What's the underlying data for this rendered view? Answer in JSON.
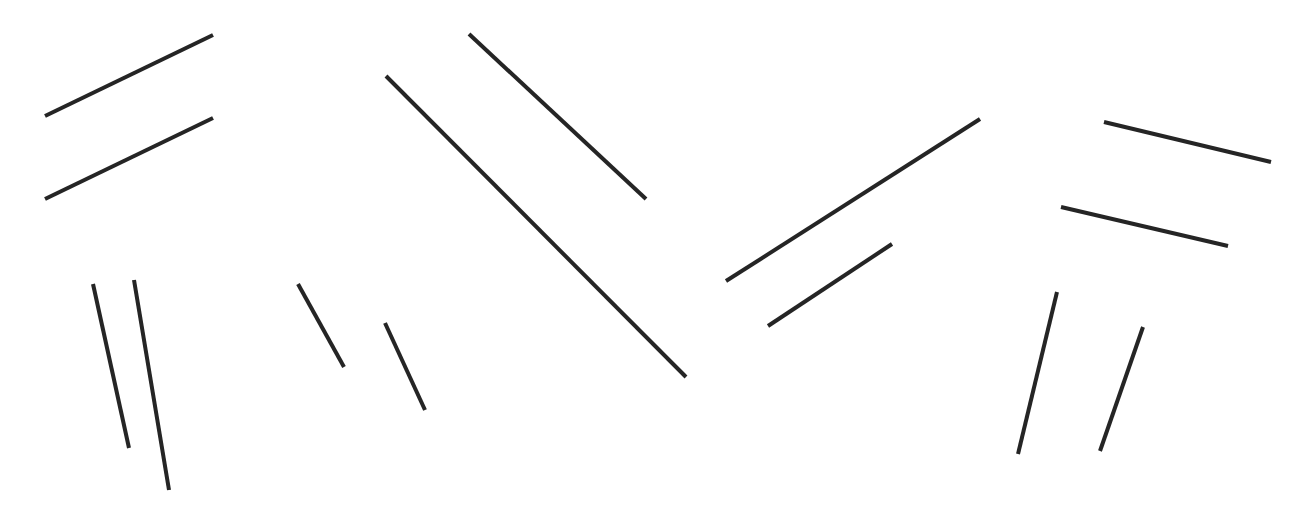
{
  "canvas": {
    "width": 1304,
    "height": 525,
    "background": "#ffffff"
  },
  "style": {
    "stroke": "#252525",
    "stroke_width": 4
  },
  "segments": [
    {
      "id": "pair1-a",
      "x1": 45,
      "y1": 116,
      "x2": 213,
      "y2": 35
    },
    {
      "id": "pair1-b",
      "x1": 45,
      "y1": 199,
      "x2": 213,
      "y2": 118
    },
    {
      "id": "pair2-a",
      "x1": 93,
      "y1": 284,
      "x2": 129,
      "y2": 448
    },
    {
      "id": "pair2-b",
      "x1": 134,
      "y1": 280,
      "x2": 169,
      "y2": 490
    },
    {
      "id": "pair3-a",
      "x1": 298,
      "y1": 284,
      "x2": 344,
      "y2": 367
    },
    {
      "id": "pair3-b",
      "x1": 385,
      "y1": 323,
      "x2": 425,
      "y2": 410
    },
    {
      "id": "pair4-a",
      "x1": 386,
      "y1": 76,
      "x2": 686,
      "y2": 377
    },
    {
      "id": "pair4-b",
      "x1": 469,
      "y1": 34,
      "x2": 646,
      "y2": 199
    },
    {
      "id": "pair5-a",
      "x1": 726,
      "y1": 281,
      "x2": 980,
      "y2": 119
    },
    {
      "id": "pair5-b",
      "x1": 768,
      "y1": 326,
      "x2": 892,
      "y2": 244
    },
    {
      "id": "pair6-a",
      "x1": 1104,
      "y1": 122,
      "x2": 1271,
      "y2": 162
    },
    {
      "id": "pair6-b",
      "x1": 1061,
      "y1": 207,
      "x2": 1228,
      "y2": 246
    },
    {
      "id": "pair7-a",
      "x1": 1057,
      "y1": 292,
      "x2": 1018,
      "y2": 454
    },
    {
      "id": "pair7-b",
      "x1": 1143,
      "y1": 327,
      "x2": 1100,
      "y2": 451
    }
  ]
}
